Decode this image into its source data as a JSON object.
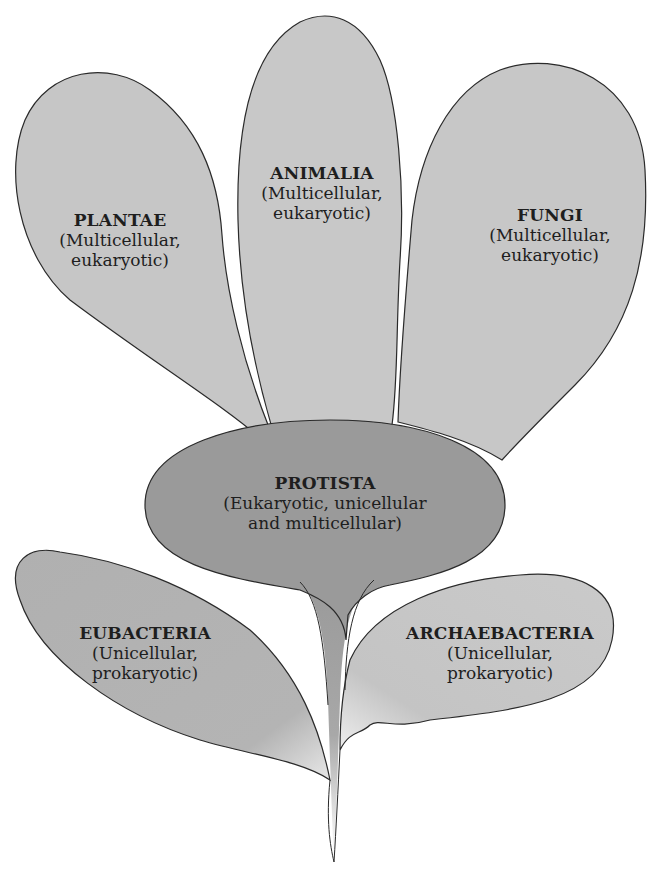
{
  "diagram": {
    "type": "kingdom-tree",
    "colors": {
      "petal_light": "#c7c7c7",
      "petal_mid": "#b4b4b4",
      "protista": "#9a9a9a",
      "stem": "#a0a0a0",
      "outline": "#2a2a2a",
      "text": "#1e1e1e"
    },
    "nodes": {
      "plantae": {
        "name": "PLANTAE",
        "desc_line1": "(Multicellular,",
        "desc_line2": "eukaryotic)"
      },
      "animalia": {
        "name": "ANIMALIA",
        "desc_line1": "(Multicellular,",
        "desc_line2": "eukaryotic)"
      },
      "fungi": {
        "name": "FUNGI",
        "desc_line1": "(Multicellular,",
        "desc_line2": "eukaryotic)"
      },
      "protista": {
        "name": "PROTISTA",
        "desc_line1": "(Eukaryotic, unicellular",
        "desc_line2": "and multicellular)"
      },
      "eubacteria": {
        "name": "EUBACTERIA",
        "desc_line1": "(Unicellular,",
        "desc_line2": "prokaryotic)"
      },
      "archaebacteria": {
        "name": "ARCHAEBACTERIA",
        "desc_line1": "(Unicellular,",
        "desc_line2": "prokaryotic)"
      }
    }
  }
}
